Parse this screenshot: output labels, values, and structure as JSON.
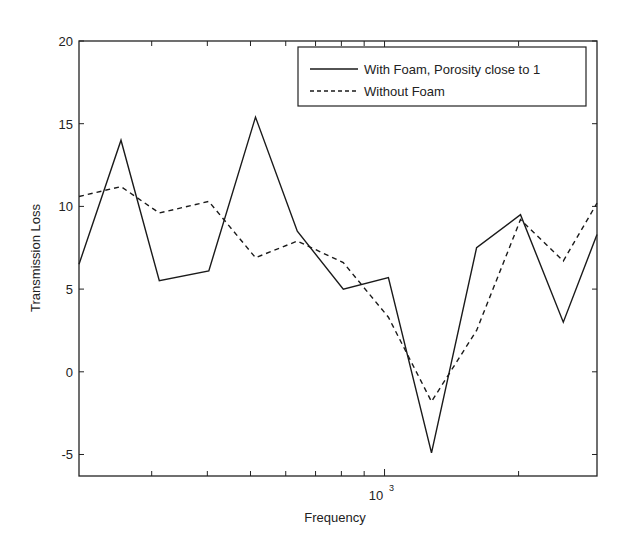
{
  "chart_data": {
    "type": "line",
    "title": "",
    "xlabel": "Frequency",
    "ylabel": "Transmission Loss",
    "xscale": "log",
    "xlim": [
      206,
      3000
    ],
    "ylim": [
      -6.3,
      20
    ],
    "grid": false,
    "legend_position": "upper right",
    "y_ticks": [
      -5,
      0,
      5,
      10,
      15,
      20
    ],
    "y_tick_labels": [
      "-5",
      "0",
      "5",
      "10",
      "15",
      "20"
    ],
    "x_major_ticks": [
      1000
    ],
    "x_major_tick_labels": [
      "10",
      "3"
    ],
    "x_minor_ticks": [
      300,
      400,
      500,
      600,
      700,
      800,
      900,
      2000
    ],
    "x": [
      206,
      256,
      312,
      403,
      513,
      637,
      808,
      1020,
      1275,
      1610,
      2020,
      2520,
      3000
    ],
    "series": [
      {
        "name": "With Foam, Porosity close to 1",
        "style": "solid",
        "values": [
          6.5,
          14.0,
          5.5,
          6.1,
          15.4,
          8.5,
          5.0,
          5.7,
          -4.9,
          7.5,
          9.5,
          3.0,
          8.3
        ]
      },
      {
        "name": "Without Foam",
        "style": "dashed",
        "values": [
          10.6,
          11.2,
          9.6,
          10.3,
          6.9,
          7.9,
          6.6,
          3.3,
          -1.8,
          2.5,
          9.2,
          6.7,
          10.2
        ]
      }
    ]
  },
  "legend": {
    "items": [
      {
        "label": "With Foam, Porosity close to 1",
        "style": "solid"
      },
      {
        "label": "Without Foam",
        "style": "dashed"
      }
    ]
  },
  "colors": {
    "line": "#1a1a1a",
    "axis": "#222222",
    "background": "#ffffff"
  }
}
